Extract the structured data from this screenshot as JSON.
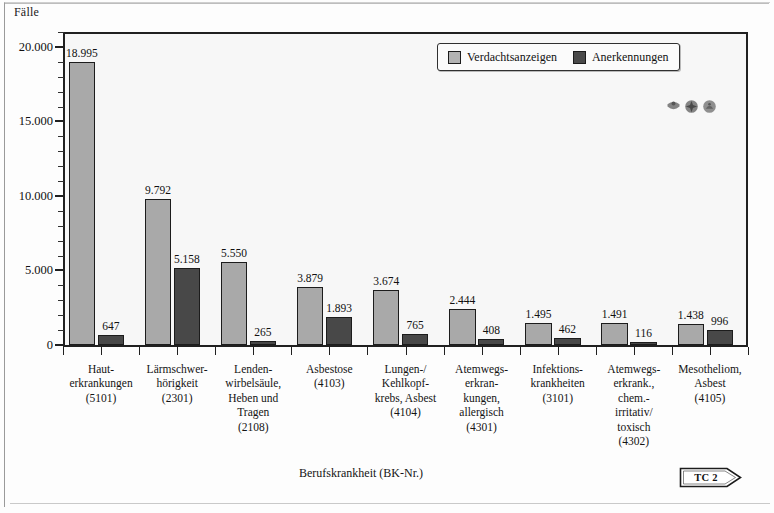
{
  "figure": {
    "y_axis_caption": "Fälle",
    "x_axis_title": "Berufskrankheit (BK-Nr.)",
    "badge_label": "TC 2"
  },
  "legend": {
    "position": "top-right-inside",
    "items": [
      {
        "label": "Verdachtsanzeigen",
        "color": "#b3b3b3",
        "swatch": "light"
      },
      {
        "label": "Anerkennungen",
        "color": "#4a4a4a",
        "swatch": "dark"
      }
    ]
  },
  "emblems": [
    {
      "name": "emblem-crest-icon"
    },
    {
      "name": "emblem-star-cross-icon"
    },
    {
      "name": "emblem-round-icon"
    }
  ],
  "y_axis": {
    "ticks": [
      "0",
      "5.000",
      "10.000",
      "15.000",
      "20.000"
    ],
    "tick_values": [
      0,
      5000,
      10000,
      15000,
      20000
    ],
    "minor_step": 1000,
    "min": 0,
    "max": 21000
  },
  "chart_data": {
    "type": "bar",
    "title": "",
    "xlabel": "Berufskrankheit (BK-Nr.)",
    "ylabel": "Fälle",
    "ylim": [
      0,
      21000
    ],
    "grid": false,
    "legend_position": "top-right-inside",
    "categories": [
      "Haut-\nerkrankungen\n(5101)",
      "Lärmschwer-\nhörigkeit\n(2301)",
      "Lenden-\nwirbelsäule,\nHeben und\nTragen\n(2108)",
      "Asbestose\n(4103)",
      "Lungen-/\nKehlkopf-\nkrebs, Asbest\n(4104)",
      "Atemwegs-\nerkran-\nkungen,\nallergisch\n(4301)",
      "Infektions-\nkrankheiten\n(3101)",
      "Atemwegs-\nerkrank.,\nchem.-\nirritativ/\ntoxisch\n(4302)",
      "Mesotheliom,\nAsbest\n(4105)"
    ],
    "category_lines": [
      [
        "Haut-",
        "erkrankungen",
        "(5101)"
      ],
      [
        "Lärmschwer-",
        "hörigkeit",
        "(2301)"
      ],
      [
        "Lenden-",
        "wirbelsäule,",
        "Heben und",
        "Tragen",
        "(2108)"
      ],
      [
        "Asbestose",
        "(4103)"
      ],
      [
        "Lungen-/",
        "Kehlkopf-",
        "krebs, Asbest",
        "(4104)"
      ],
      [
        "Atemwegs-",
        "erkran-",
        "kungen,",
        "allergisch",
        "(4301)"
      ],
      [
        "Infektions-",
        "krankheiten",
        "(3101)"
      ],
      [
        "Atemwegs-",
        "erkrank.,",
        "chem.-",
        "irritativ/",
        "toxisch",
        "(4302)"
      ],
      [
        "Mesotheliom,",
        "Asbest",
        "(4105)"
      ]
    ],
    "bk_numbers": [
      "5101",
      "2301",
      "2108",
      "4103",
      "4104",
      "4301",
      "3101",
      "4302",
      "4105"
    ],
    "series": [
      {
        "name": "Verdachtsanzeigen",
        "color": "#a9a9a9",
        "values": [
          18995,
          9792,
          5550,
          3879,
          3674,
          2444,
          1495,
          1491,
          1438
        ],
        "labels": [
          "18.995",
          "9.792",
          "5.550",
          "3.879",
          "3.674",
          "2.444",
          "1.495",
          "1.491",
          "1.438"
        ]
      },
      {
        "name": "Anerkennungen",
        "color": "#484848",
        "values": [
          647,
          5158,
          265,
          1893,
          765,
          408,
          462,
          116,
          996
        ],
        "labels": [
          "647",
          "5.158",
          "265",
          "1.893",
          "765",
          "408",
          "462",
          "116",
          "996"
        ]
      }
    ]
  }
}
